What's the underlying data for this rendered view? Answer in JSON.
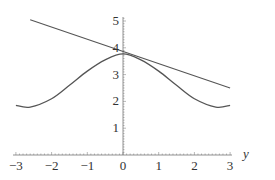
{
  "chart_data": {
    "type": "line",
    "title": "",
    "xlabel": "y",
    "ylabel": "",
    "xlim": [
      -3,
      3
    ],
    "ylim": [
      0,
      5
    ],
    "grid": false,
    "x_ticks": [
      "-3",
      "-2",
      "-1",
      "0",
      "1",
      "2",
      "3"
    ],
    "y_ticks": [
      "1",
      "2",
      "3",
      "4",
      "5"
    ],
    "series": [
      {
        "name": "curve",
        "x": [
          -3,
          -2.6,
          -2,
          -1.5,
          -1,
          -0.5,
          0,
          0.5,
          1,
          1.5,
          2,
          2.6,
          3
        ],
        "values": [
          1.85,
          1.79,
          2.1,
          2.6,
          3.13,
          3.55,
          3.77,
          3.55,
          3.13,
          2.6,
          2.1,
          1.79,
          1.85
        ]
      },
      {
        "name": "tangent line",
        "x": [
          -2.6,
          3
        ],
        "values": [
          5.05,
          2.5
        ]
      }
    ]
  },
  "labels": {
    "xaxis_var": "y",
    "x_ticks": [
      "−3",
      "−2",
      "−1",
      "0",
      "1",
      "2",
      "3"
    ],
    "y_ticks": [
      "1",
      "2",
      "3",
      "4",
      "5"
    ]
  }
}
